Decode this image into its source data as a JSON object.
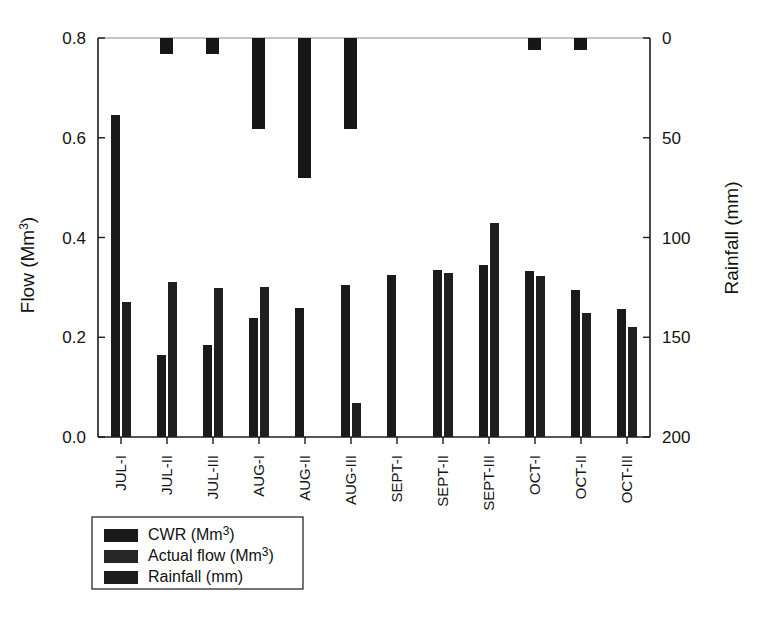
{
  "chart_data": {
    "type": "bar",
    "title": "",
    "subtitle": "",
    "xlabel": "",
    "ylabel": "Flow (Mm3)",
    "ylabel_display": "Flow (Mm",
    "ylabel_sup": "3",
    "ylabel_tail": ")",
    "y2label_display": "Rainfall (mm)",
    "grid": false,
    "legend_position": "below-left",
    "categories": [
      "JUL-I",
      "JUL-II",
      "JUL-III",
      "AUG-I",
      "AUG-II",
      "AUG-III",
      "SEPT-I",
      "SEPT-II",
      "SEPT-III",
      "OCT-I",
      "OCT-II",
      "OCT-III"
    ],
    "yticks": [
      "0.0",
      "0.2",
      "0.4",
      "0.6",
      "0.8"
    ],
    "ytick_values": [
      0.0,
      0.2,
      0.4,
      0.6,
      0.8
    ],
    "ylim": [
      0.0,
      0.8
    ],
    "y2ticks": [
      "0",
      "50",
      "100",
      "150",
      "200"
    ],
    "y2tick_values": [
      0,
      50,
      100,
      150,
      200
    ],
    "y2lim": [
      200,
      0
    ],
    "y2_inverted": true,
    "series": [
      {
        "name": "CWR (Mm3)",
        "label_display": "CWR (Mm",
        "label_sup": "3",
        "label_tail": ")",
        "axis": "left",
        "color": "#1a1a1a",
        "values": [
          0.645,
          0.165,
          0.185,
          0.238,
          0.258,
          0.305,
          0.325,
          0.334,
          0.345,
          0.333,
          0.294,
          0.257
        ]
      },
      {
        "name": "Actual flow (Mm3)",
        "label_display": "Actual flow (Mm",
        "label_sup": "3",
        "label_tail": ")",
        "axis": "left",
        "color": "#1f1f1f",
        "values": [
          0.271,
          0.311,
          0.298,
          0.3,
          0.0,
          0.069,
          0.0,
          0.329,
          0.43,
          0.322,
          0.249,
          0.22
        ]
      },
      {
        "name": "Rainfall (mm)",
        "label_display": "Rainfall (mm)",
        "label_sup": "",
        "label_tail": "",
        "axis": "right",
        "color": "#171717",
        "values": [
          0.0,
          8.0,
          8.0,
          45.5,
          70.0,
          45.5,
          0.0,
          0.0,
          0.0,
          6.0,
          6.0,
          0.0
        ]
      }
    ]
  },
  "legend": {
    "entries": [
      {
        "label_display": "CWR (Mm",
        "label_sup": "3",
        "label_tail": ")",
        "color": "#1a1a1a"
      },
      {
        "label_display": "Actual flow (Mm",
        "label_sup": "3",
        "label_tail": ")",
        "color": "#262626"
      },
      {
        "label_display": "Rainfall (mm)",
        "label_sup": "",
        "label_tail": "",
        "color": "#1d1d1d"
      }
    ]
  }
}
